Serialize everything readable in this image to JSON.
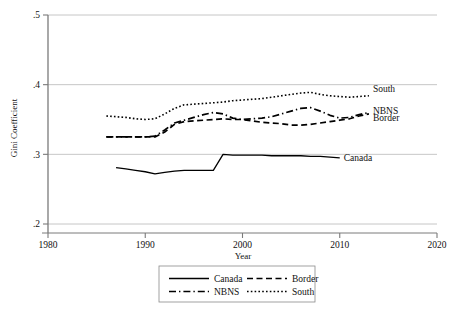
{
  "chart_data": {
    "type": "line",
    "title": "",
    "xlabel": "Year",
    "ylabel": "Gini Coefficient",
    "xlim": [
      1980,
      2020
    ],
    "ylim": [
      0.2,
      0.5
    ],
    "xticks": [
      1980,
      1990,
      2000,
      2010,
      2020
    ],
    "xtick_labels": [
      "1980",
      "1990",
      "2000",
      "2010",
      "2020"
    ],
    "yticks": [
      0.2,
      0.3,
      0.4,
      0.5
    ],
    "ytick_labels": [
      ".2",
      ".3",
      ".4",
      ".5"
    ],
    "grid": "horizontal",
    "legend_position": "below-center",
    "series": [
      {
        "name": "Canada",
        "style": "solid",
        "end_label": "Canada",
        "x": [
          1987,
          1988,
          1989,
          1990,
          1991,
          1992,
          1993,
          1994,
          1995,
          1996,
          1997,
          1998,
          1999,
          2000,
          2001,
          2002,
          2003,
          2004,
          2005,
          2006,
          2007,
          2008,
          2009,
          2010
        ],
        "y": [
          0.281,
          0.279,
          0.277,
          0.275,
          0.272,
          0.274,
          0.276,
          0.277,
          0.277,
          0.277,
          0.277,
          0.3,
          0.299,
          0.299,
          0.299,
          0.299,
          0.298,
          0.298,
          0.298,
          0.298,
          0.297,
          0.297,
          0.296,
          0.295
        ]
      },
      {
        "name": "Border",
        "style": "dashed",
        "end_label": "Border",
        "x": [
          1986,
          1987,
          1988,
          1989,
          1990,
          1991,
          1992,
          1993,
          1994,
          1995,
          1996,
          1997,
          1998,
          1999,
          2000,
          2001,
          2002,
          2003,
          2004,
          2005,
          2006,
          2007,
          2008,
          2009,
          2010,
          2011,
          2012,
          2013
        ],
        "y": [
          0.325,
          0.325,
          0.325,
          0.325,
          0.325,
          0.325,
          0.332,
          0.343,
          0.347,
          0.348,
          0.349,
          0.35,
          0.351,
          0.35,
          0.35,
          0.348,
          0.346,
          0.345,
          0.344,
          0.342,
          0.342,
          0.343,
          0.345,
          0.347,
          0.349,
          0.351,
          0.355,
          0.358
        ]
      },
      {
        "name": "NBNS",
        "style": "dashdot",
        "end_label": "NBNS",
        "x": [
          1986,
          1987,
          1988,
          1989,
          1990,
          1991,
          1992,
          1993,
          1994,
          1995,
          1996,
          1997,
          1998,
          1999,
          2000,
          2001,
          2002,
          2003,
          2004,
          2005,
          2006,
          2007,
          2008,
          2009,
          2010,
          2011,
          2012,
          2013
        ],
        "y": [
          0.325,
          0.325,
          0.325,
          0.325,
          0.325,
          0.326,
          0.335,
          0.345,
          0.349,
          0.353,
          0.357,
          0.36,
          0.358,
          0.352,
          0.35,
          0.351,
          0.352,
          0.354,
          0.358,
          0.362,
          0.366,
          0.367,
          0.362,
          0.356,
          0.352,
          0.353,
          0.357,
          0.36
        ]
      },
      {
        "name": "South",
        "style": "dotted",
        "end_label": "South",
        "x": [
          1986,
          1987,
          1988,
          1989,
          1990,
          1991,
          1992,
          1993,
          1994,
          1995,
          1996,
          1997,
          1998,
          1999,
          2000,
          2001,
          2002,
          2003,
          2004,
          2005,
          2006,
          2007,
          2008,
          2009,
          2010,
          2011,
          2012,
          2013
        ],
        "y": [
          0.355,
          0.354,
          0.353,
          0.351,
          0.35,
          0.351,
          0.358,
          0.366,
          0.371,
          0.372,
          0.373,
          0.374,
          0.375,
          0.377,
          0.378,
          0.379,
          0.38,
          0.382,
          0.384,
          0.386,
          0.388,
          0.389,
          0.386,
          0.384,
          0.383,
          0.382,
          0.383,
          0.384
        ]
      }
    ],
    "legend_entries": [
      {
        "label": "Canada",
        "style": "solid"
      },
      {
        "label": "Border",
        "style": "dashed"
      },
      {
        "label": "NBNS",
        "style": "dashdot"
      },
      {
        "label": "South",
        "style": "dotted"
      }
    ],
    "colors": {
      "line": "#000000",
      "axis": "#7a7a7a",
      "grid": "#b8b8b8",
      "background": "#ffffff",
      "text": "#111111"
    }
  }
}
